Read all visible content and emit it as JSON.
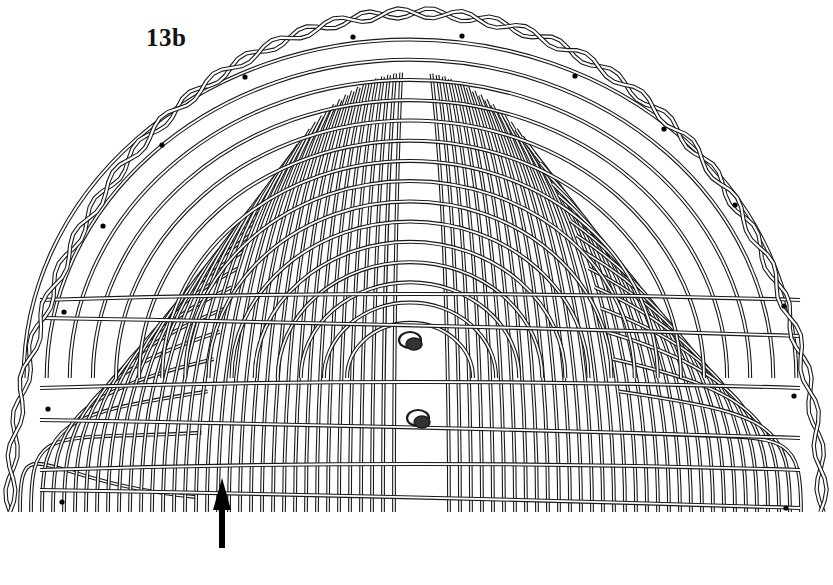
{
  "figure": {
    "label": "13b",
    "colors": {
      "background": "#ffffff",
      "stroke": "#1a1a1a",
      "strand_fill": "#ffffff"
    },
    "arrow": {
      "direction": "up",
      "x": 222,
      "y_tip": 478,
      "y_tail": 548
    },
    "marker_dots": [
      {
        "x": 353,
        "y": 37
      },
      {
        "x": 462,
        "y": 36
      },
      {
        "x": 245,
        "y": 77
      },
      {
        "x": 575,
        "y": 76
      },
      {
        "x": 162,
        "y": 145
      },
      {
        "x": 664,
        "y": 129
      },
      {
        "x": 103,
        "y": 226
      },
      {
        "x": 735,
        "y": 205
      },
      {
        "x": 64,
        "y": 312
      },
      {
        "x": 784,
        "y": 306
      },
      {
        "x": 48,
        "y": 409
      },
      {
        "x": 794,
        "y": 396
      },
      {
        "x": 62,
        "y": 502
      },
      {
        "x": 786,
        "y": 508
      }
    ],
    "center_knots": [
      {
        "x": 410,
        "y": 340
      },
      {
        "x": 418,
        "y": 418
      }
    ],
    "fringe_baseline_y": 512
  }
}
